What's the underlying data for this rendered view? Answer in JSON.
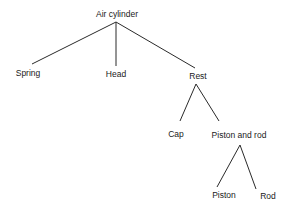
{
  "diagram": {
    "type": "tree",
    "nodes": [
      {
        "id": "air-cylinder",
        "label": "Air cylinder",
        "x": 117,
        "y": 14
      },
      {
        "id": "spring",
        "label": "Spring",
        "x": 28,
        "y": 73
      },
      {
        "id": "head",
        "label": "Head",
        "x": 116,
        "y": 74
      },
      {
        "id": "rest",
        "label": "Rest",
        "x": 198,
        "y": 76
      },
      {
        "id": "cap",
        "label": "Cap",
        "x": 176,
        "y": 134
      },
      {
        "id": "piston-and-rod",
        "label": "Piston and rod",
        "x": 239,
        "y": 135
      },
      {
        "id": "piston",
        "label": "Piston",
        "x": 224,
        "y": 195
      },
      {
        "id": "rod",
        "label": "Rod",
        "x": 268,
        "y": 196
      }
    ],
    "edges": [
      {
        "from": "air-cylinder",
        "to": "spring",
        "x1": 116,
        "y1": 22,
        "x2": 32,
        "y2": 64
      },
      {
        "from": "air-cylinder",
        "to": "head",
        "x1": 116,
        "y1": 22,
        "x2": 116,
        "y2": 66
      },
      {
        "from": "air-cylinder",
        "to": "rest",
        "x1": 116,
        "y1": 22,
        "x2": 195,
        "y2": 68
      },
      {
        "from": "rest",
        "to": "cap",
        "x1": 196,
        "y1": 84,
        "x2": 180,
        "y2": 121
      },
      {
        "from": "rest",
        "to": "piston-and-rod",
        "x1": 196,
        "y1": 84,
        "x2": 219,
        "y2": 121
      },
      {
        "from": "piston-and-rod",
        "to": "piston",
        "x1": 240,
        "y1": 145,
        "x2": 217,
        "y2": 187
      },
      {
        "from": "piston-and-rod",
        "to": "rod",
        "x1": 240,
        "y1": 145,
        "x2": 256,
        "y2": 189
      }
    ]
  }
}
